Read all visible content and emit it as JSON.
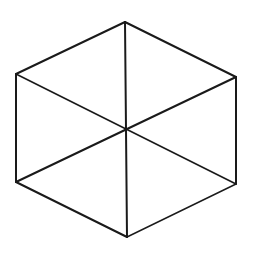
{
  "diagram": {
    "type": "hexagon-with-diagonals",
    "stroke_color": "#1a1a1a",
    "background": "#ffffff",
    "center": [
      126,
      129
    ],
    "vertices": {
      "top": [
        125,
        22
      ],
      "upper_right": [
        236,
        77
      ],
      "lower_right": [
        236,
        184
      ],
      "bottom": [
        127,
        237
      ],
      "lower_left": [
        16,
        182
      ],
      "upper_left": [
        16,
        74
      ]
    },
    "edges": [
      {
        "name": "edge-top-upper-right",
        "from": "top",
        "to": "upper_right",
        "width": 2
      },
      {
        "name": "edge-upper-right-lower-right",
        "from": "upper_right",
        "to": "lower_right",
        "width": 2
      },
      {
        "name": "edge-lower-right-bottom",
        "from": "lower_right",
        "to": "bottom",
        "width": 1.4
      },
      {
        "name": "edge-bottom-lower-left",
        "from": "bottom",
        "to": "lower_left",
        "width": 2
      },
      {
        "name": "edge-lower-left-upper-left",
        "from": "lower_left",
        "to": "upper_left",
        "width": 2
      },
      {
        "name": "edge-upper-left-top",
        "from": "upper_left",
        "to": "top",
        "width": 2
      }
    ],
    "diagonals": [
      {
        "name": "diagonal-top-bottom",
        "from": "top",
        "to": "bottom",
        "width": 2
      },
      {
        "name": "diagonal-upper-left-lower-right",
        "from": "upper_left",
        "to": "lower_right",
        "width": 1.6
      },
      {
        "name": "diagonal-upper-right-lower-left",
        "from": "upper_right",
        "to": "lower_left",
        "width": 2
      }
    ]
  }
}
